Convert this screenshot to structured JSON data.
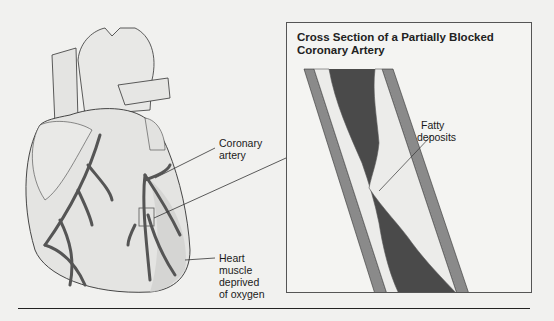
{
  "figure": {
    "heart_labels": {
      "coronary_artery": [
        "Coronary",
        "artery"
      ],
      "heart_muscle": [
        "Heart",
        "muscle",
        "deprived",
        "of oxygen"
      ]
    },
    "inset": {
      "title_line1": "Cross Section of a Partially Blocked",
      "title_line2": "Coronary Artery",
      "fatty_label": [
        "Fatty",
        "deposits"
      ]
    },
    "colors": {
      "background": "#f1f1ef",
      "artery_wall": "#8a8a8a",
      "lumen": "#4a4a4a",
      "plaque": "#e8e8e4",
      "heart_fill": "#e6e6e4",
      "vessel": "#555555"
    }
  }
}
